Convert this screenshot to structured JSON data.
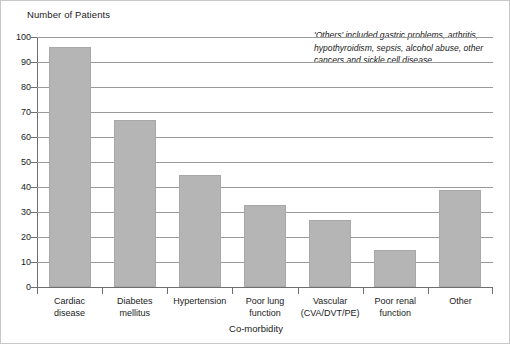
{
  "chart_data": {
    "type": "bar",
    "title": "",
    "ylabel": "Number of Patients",
    "xlabel": "Co-morbidity",
    "categories": [
      "Cardiac disease",
      "Diabetes mellitus",
      "Hypertension",
      "Poor lung function",
      "Vascular (CVA/DVT/PE)",
      "Poor renal function",
      "Other"
    ],
    "category_lines": [
      [
        "Cardiac",
        "disease"
      ],
      [
        "Diabetes",
        "mellitus"
      ],
      [
        "Hypertension"
      ],
      [
        "Poor lung",
        "function"
      ],
      [
        "Vascular",
        "(CVA/DVT/PE)"
      ],
      [
        "Poor renal",
        "function"
      ],
      [
        "Other"
      ]
    ],
    "values": [
      96,
      67,
      45,
      33,
      27,
      15,
      39
    ],
    "ylim": [
      0,
      100
    ],
    "y_ticks": [
      100,
      90,
      80,
      70,
      60,
      50,
      40,
      30,
      20,
      10,
      0
    ],
    "y_tick_labels": [
      "100",
      "90",
      "80",
      "70",
      "60",
      "50",
      "40",
      "30",
      "20",
      "10",
      "0"
    ],
    "grid": true,
    "legend": "none",
    "annotations": [
      "'Others' included gastric problems, arthritis, hypothyroidism, sepsis, alcohol abuse, other cancers and sickle cell disease."
    ],
    "colors": {
      "bar_fill": "#b5b5b5",
      "bar_border": "#a8a8a8",
      "gridline": "#9a9a9a",
      "axis": "#6e6e6e",
      "text": "#1a1a1a",
      "background": "#ffffff"
    }
  }
}
